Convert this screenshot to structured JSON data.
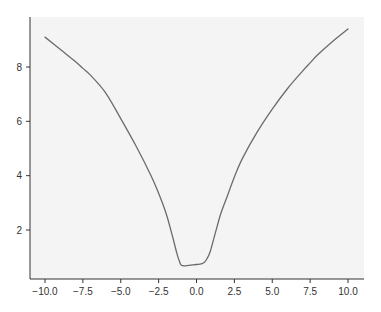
{
  "chart_data": {
    "type": "line",
    "title": "",
    "xlabel": "",
    "ylabel": "",
    "xlim": [
      -11.0,
      10.9
    ],
    "ylim": [
      0.2,
      9.7
    ],
    "grid": false,
    "legend": null,
    "x_ticks": [
      -10.0,
      -7.5,
      -5.0,
      -2.5,
      0.0,
      2.5,
      5.0,
      7.5,
      10.0
    ],
    "x_tick_labels": [
      "−10.0",
      "−7.5",
      "−5.0",
      "−2.5",
      "0.0",
      "2.5",
      "5.0",
      "7.5",
      "10.0"
    ],
    "y_ticks": [
      2,
      4,
      6,
      8
    ],
    "y_tick_labels": [
      "2",
      "4",
      "6",
      "8"
    ],
    "series": [
      {
        "name": "curve",
        "color": "#6b6b6b",
        "x": [
          -10.0,
          -9.0,
          -8.0,
          -7.5,
          -7.0,
          -6.0,
          -5.0,
          -4.0,
          -3.0,
          -2.5,
          -2.0,
          -1.6,
          -1.3,
          -1.1,
          -1.0,
          -0.8,
          -0.5,
          0.0,
          0.3,
          0.5,
          0.7,
          0.9,
          1.2,
          1.6,
          2.0,
          2.5,
          3.0,
          4.0,
          5.0,
          6.0,
          7.0,
          7.5,
          8.0,
          9.0,
          10.0
        ],
        "y": [
          9.1,
          8.65,
          8.2,
          7.95,
          7.7,
          7.05,
          6.1,
          5.1,
          4.0,
          3.35,
          2.6,
          1.8,
          1.15,
          0.8,
          0.7,
          0.68,
          0.7,
          0.73,
          0.75,
          0.8,
          0.95,
          1.2,
          1.8,
          2.6,
          3.2,
          3.95,
          4.6,
          5.6,
          6.45,
          7.2,
          7.85,
          8.15,
          8.45,
          8.95,
          9.4
        ]
      }
    ]
  },
  "colors": {
    "plot_background": "#f4f4f4",
    "axis": "#333333",
    "line": "#6b6b6b"
  }
}
